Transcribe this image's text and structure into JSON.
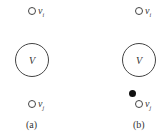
{
  "panels": [
    {
      "id": "a",
      "top_vertex": {
        "label": "v",
        "sub": "i"
      },
      "center": {
        "label": "V"
      },
      "bottom_vertex": {
        "label": "v",
        "sub": "j"
      },
      "caption": "(a)"
    },
    {
      "id": "b",
      "top_vertex": {
        "label": "v",
        "sub": "i"
      },
      "center": {
        "label": "V"
      },
      "bottom_vertex": {
        "label": "v",
        "sub": "j"
      },
      "extra_filled_vertex": true,
      "caption": "(b)"
    }
  ]
}
